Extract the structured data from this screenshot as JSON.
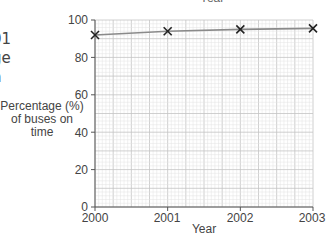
{
  "page": {
    "top_cut_text": "Year",
    "left_cut_lines": [
      "01",
      "ge",
      "n"
    ]
  },
  "chart_data": {
    "type": "line",
    "title": "",
    "xlabel": "Year",
    "ylabel": "Percentage (%) of buses on time",
    "ylabel_lines": [
      "Percentage (%)",
      "of buses on",
      "time"
    ],
    "x": [
      2000,
      2001,
      2002,
      2003
    ],
    "x_tick_labels": [
      "2000",
      "2001",
      "2002",
      "2003"
    ],
    "y_tick_labels": [
      "0",
      "20",
      "40",
      "60",
      "80",
      "100"
    ],
    "series": [
      {
        "name": "Percentage of buses on time",
        "values": [
          92,
          94,
          95,
          95.5
        ],
        "marker": "x"
      }
    ],
    "xlim": [
      2000,
      2003
    ],
    "ylim": [
      0,
      100
    ],
    "grid": true,
    "legend": "none",
    "colors": {
      "line": "#8a8a8a",
      "marker": "#222222",
      "grid_minor": "#e2e2e2",
      "grid_major": "#c4c4c4",
      "axis": "#555555"
    }
  }
}
